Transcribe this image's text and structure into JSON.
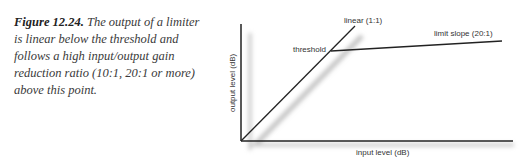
{
  "caption": {
    "label": "Figure 12.24.",
    "text": " The output of a limiter is linear below the threshold and follows a high input/output gain reduction ratio (10:1, 20:1 or more) above this point."
  },
  "diagram": {
    "x_axis_label": "input level (dB)",
    "y_axis_label": "output level (dB)",
    "threshold_label": "threshold",
    "linear_label": "linear (1:1)",
    "limit_label": "limit slope (20:1)",
    "colors": {
      "line": "#222222",
      "shadow": "#c8c8c8"
    }
  }
}
